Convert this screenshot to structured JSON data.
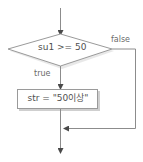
{
  "diagram": {
    "type": "flowchart",
    "decision": {
      "condition": "su1 >= 50"
    },
    "branches": {
      "true_label": "true",
      "false_label": "false"
    },
    "process": {
      "statement": "str = \"50이상\""
    },
    "colors": {
      "line": "#8c8c8c",
      "shape_fill": "#ffffff",
      "shape_stroke": "#9a9a9a",
      "shadow": "#c8c8c8",
      "text": "#505050"
    }
  }
}
